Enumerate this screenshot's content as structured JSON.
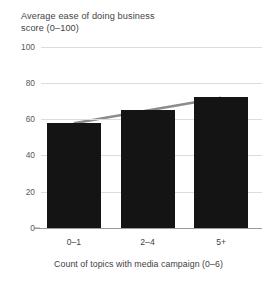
{
  "chart_data": {
    "type": "bar",
    "title": "Average ease of doing business\nscore (0–100)",
    "xlabel": "Count of topics with media campaign (0–6)",
    "ylabel": "",
    "categories": [
      "0–1",
      "2–4",
      "5+"
    ],
    "values": [
      58,
      65,
      72
    ],
    "ylim": [
      0,
      100
    ],
    "yticks": [
      0,
      20,
      40,
      60,
      80,
      100
    ],
    "ytick_labels": [
      "0",
      "20",
      "40",
      "60",
      "80",
      "100"
    ],
    "grid": true,
    "legend": "none",
    "series": [
      {
        "name": "Average ease of doing business score",
        "type": "bar",
        "values": [
          58,
          65,
          72
        ],
        "color": "#141414"
      },
      {
        "name": "Trend line",
        "type": "line",
        "values": [
          58,
          65,
          72
        ],
        "color": "#8c8c8c"
      }
    ]
  },
  "colors": {
    "bar": "#141414",
    "trend": "#8c8c8c",
    "grid": "#dcdcdc",
    "axis": "#9a9a9a",
    "text": "#3f3f3f",
    "background": "#ffffff"
  }
}
